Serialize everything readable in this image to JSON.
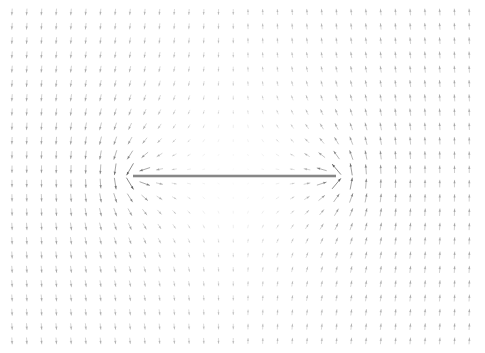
{
  "figure": {
    "width": 485,
    "height": 353,
    "background_color": "#ffffff",
    "title": "",
    "xlabel": "",
    "ylabel": "",
    "axes_visible": false,
    "ticks_visible": false,
    "legend_visible": false,
    "frame_visible": false
  },
  "plate": {
    "name": "flat-plate-segment",
    "x_start_px": 133,
    "x_end_px": 336,
    "y_px": 176,
    "thickness_px": 2.6,
    "color": "#8c8c8c",
    "edge_color": "#7a7a7a"
  },
  "chart_data": {
    "type": "quiver",
    "title": "",
    "subtitle": "",
    "xlabel": "",
    "ylabel": "",
    "grid": false,
    "legend": null,
    "annotations": [],
    "xlim": [
      -1.62,
      1.62
    ],
    "ylim": [
      -1.18,
      1.18
    ],
    "axis_ranges_note": "Normalized plate half-length a = 1; plate spans x in [-1, 1] at y = 0",
    "grid_shape": {
      "columns": 32,
      "rows": 24
    },
    "grid_origin_px": {
      "x": 12,
      "y": 12
    },
    "grid_spacing_px": {
      "x": 14.75,
      "y": 14.3
    },
    "arrow_style": {
      "color": "#555555",
      "max_opacity": 0.85,
      "min_opacity": 0.04,
      "head_length_px": 3.2,
      "head_width_px": 2.2,
      "max_length_px": 13.0,
      "line_width_px": 0.8
    },
    "field": {
      "model": "potential-flow-normal-to-flat-plate",
      "description": "Velocity vector field of incompressible potential flow directed normal to a finite flat plate of half-length a=1 centered at the origin; arrows diverge vertically away from the plate faces and converge horizontally toward the plate tips",
      "plate_half_length": 1.0,
      "plate_y": 0.0,
      "singularities": [
        {
          "name": "left-tip",
          "x": -1.0,
          "y": 0.0
        },
        {
          "name": "right-tip",
          "x": 1.0,
          "y": 0.0
        }
      ],
      "formula": {
        "complex_potential": "w(z) = -i * U * sqrt(z^2 - a^2)",
        "velocity": "u - i*v = dw/dz = -i * U * z / sqrt(z^2 - a^2)",
        "U": 1.0,
        "a": 1.0
      },
      "magnitude_scaling": "linear clamp, arrow length proportional to |V| clipped at 2.2"
    }
  }
}
